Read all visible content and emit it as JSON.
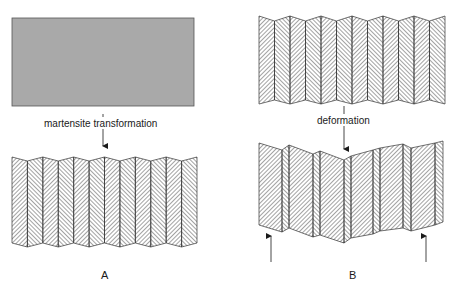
{
  "diagram": {
    "panel_a": {
      "label": "A",
      "transition_label": "martensite transformation",
      "parent_phase_color": "#a8a8a8",
      "columns": 13
    },
    "panel_b": {
      "label": "B",
      "transition_label": "deformation",
      "columns": 12
    },
    "colors": {
      "line": "#2a2a2a",
      "background": "#ffffff"
    }
  }
}
